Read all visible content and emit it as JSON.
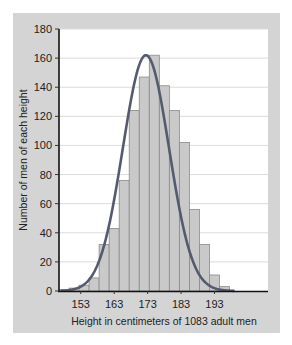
{
  "chart_data": {
    "type": "bar",
    "subtype": "histogram-with-normal-curve",
    "title": "",
    "xlabel": "Height in centimeters of 1083 adult men",
    "ylabel": "Number of men of each height",
    "ylim": [
      0,
      180
    ],
    "yticks": [
      0,
      20,
      40,
      60,
      80,
      100,
      120,
      140,
      160,
      180
    ],
    "xticks": [
      153,
      163,
      173,
      183,
      193
    ],
    "xlim": [
      146.5,
      209
    ],
    "grid": "horizontal",
    "bin_width": 3,
    "categories": [
      148,
      151,
      154,
      157,
      160,
      163,
      166,
      169,
      172,
      175,
      178,
      181,
      184,
      187,
      190,
      193,
      196
    ],
    "values": [
      1,
      2,
      4,
      9,
      32,
      43,
      76,
      124,
      147,
      162,
      141,
      124,
      102,
      56,
      32,
      11,
      3
    ],
    "curve": {
      "name": "normal curve",
      "mean": 172.5,
      "peak": 162
    },
    "colors": {
      "bar_fill": "#c9c9c9",
      "bar_stroke": "#8a8a8a",
      "curve": "#555b6e",
      "panel": "#d4d4d4",
      "plot_bg": "#ffffff",
      "grid": "#dcdcdc"
    }
  }
}
